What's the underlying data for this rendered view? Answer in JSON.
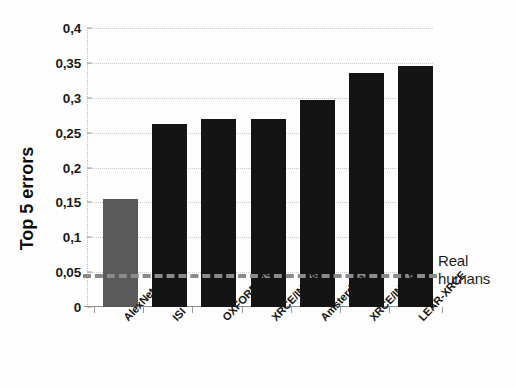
{
  "chart_data": {
    "type": "bar",
    "title": "",
    "subtitle": "",
    "xlabel": "",
    "ylabel": "Top 5 errors",
    "ylim": [
      0,
      0.4
    ],
    "grid": true,
    "legend_position": "none",
    "categories": [
      "AlexNet",
      "ISI",
      "OXFORD_VGG",
      "XRCE/INRIA",
      "Amsterdam",
      "XRCE/INRIA",
      "LEAR-XRCE"
    ],
    "values": [
      0.155,
      0.262,
      0.27,
      0.27,
      0.297,
      0.335,
      0.345
    ],
    "bar_colors": [
      "#5a5a5a",
      "#141414",
      "#141414",
      "#141414",
      "#141414",
      "#141414",
      "#141414"
    ],
    "ytick_labels": [
      "0",
      "0,05",
      "0,1",
      "0,15",
      "0,2",
      "0,25",
      "0,3",
      "0,35",
      "0,4"
    ],
    "ytick_values": [
      0,
      0.05,
      0.1,
      0.15,
      0.2,
      0.25,
      0.3,
      0.35,
      0.4
    ],
    "annotations": [
      {
        "name": "real-humans-threshold",
        "label_line1": "Real",
        "label_line2": "humans",
        "value": 0.048,
        "style": "dashed",
        "color": "#8a8a8a"
      }
    ]
  },
  "annotation": {
    "line1": "Real",
    "line2": "humans"
  },
  "axis": {
    "y_title": "Top 5 errors"
  }
}
